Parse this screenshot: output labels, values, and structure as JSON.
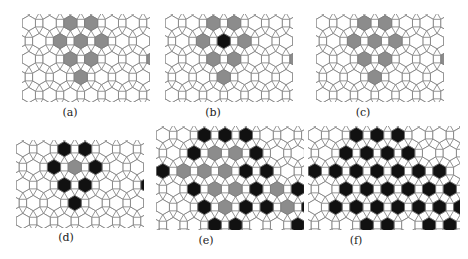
{
  "figure": {
    "tiling": "rhombitrihexagonal (3.4.6.4)",
    "colors": {
      "line": "#7a7a7a",
      "empty": "#ffffff",
      "gray": "#8c8c8c",
      "black": "#111111"
    },
    "panels": [
      {
        "id": "a",
        "label": "(a)",
        "x": 22,
        "y": 14,
        "w": 128,
        "h": 88,
        "cap_x": 70,
        "cap_y": 106,
        "hex_states": [
          "..GG....",
          ".GGG....",
          "..GG..G.",
          "..G...G."
        ],
        "square_black": [],
        "tri_white_only": true
      },
      {
        "id": "b",
        "label": "(b)",
        "x": 165,
        "y": 14,
        "w": 128,
        "h": 88,
        "cap_x": 213,
        "cap_y": 106,
        "hex_states": [
          "..GG....",
          ".GBG....",
          "..GG..G.",
          "..G...G."
        ],
        "note": "black cluster of squares/triangles around central hexagon; black square between two gray hexes at right"
      },
      {
        "id": "c",
        "label": "(c)",
        "x": 316,
        "y": 14,
        "w": 128,
        "h": 88,
        "cap_x": 363,
        "cap_y": 106,
        "hex_states": [
          "..GG....",
          ".GGG....",
          "..GG..G.",
          "..G...G."
        ],
        "note": "black squares ring the gray clusters"
      },
      {
        "id": "d",
        "label": "(d)",
        "x": 16,
        "y": 140,
        "w": 128,
        "h": 88,
        "cap_x": 66,
        "cap_y": 231,
        "hex_states": [
          "..BB....",
          ".BGB....",
          "..BB..B.",
          "..B...B."
        ]
      },
      {
        "id": "e",
        "label": "(e)",
        "x": 156,
        "y": 126,
        "w": 148,
        "h": 104,
        "cap_x": 206,
        "cap_y": 234,
        "hex_states": [
          "..BBB....",
          ".BGGB....",
          "BGGGBB..",
          ".BGGBGB.",
          "..BGBBGB",
          "..BB..BB"
        ]
      },
      {
        "id": "f",
        "label": "(f)",
        "x": 308,
        "y": 126,
        "w": 152,
        "h": 104,
        "cap_x": 356,
        "cap_y": 234,
        "hex_states": [
          "..BBB....",
          ".BBBB....",
          "BBBBBBB.",
          ".BBBBBBB",
          ".BBBBBBB",
          "..BB.BB."
        ]
      }
    ]
  }
}
